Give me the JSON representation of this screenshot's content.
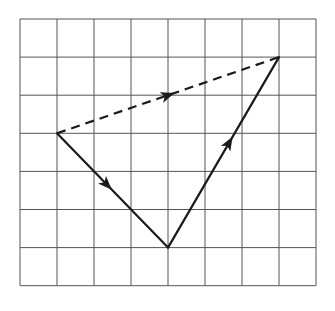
{
  "diagram": {
    "type": "vector-addition-grid",
    "grid": {
      "columns": 8,
      "rows": 7,
      "origin_px": [
        20,
        19
      ],
      "cell_width_px": 37,
      "cell_height_px": 38.1,
      "line_color": "#555555"
    },
    "points": {
      "A": [
        1,
        3
      ],
      "B": [
        4,
        6
      ],
      "C": [
        7,
        1
      ]
    },
    "vectors": [
      {
        "id": "v1",
        "from": "A",
        "to": "B",
        "style": "solid",
        "arrow_at": 0.45,
        "color": "#1a1a1a"
      },
      {
        "id": "v2",
        "from": "B",
        "to": "C",
        "style": "solid",
        "arrow_at": 0.55,
        "color": "#1a1a1a"
      },
      {
        "id": "resultant",
        "from": "A",
        "to": "C",
        "style": "dashed",
        "arrow_at": 0.5,
        "color": "#1a1a1a"
      }
    ]
  }
}
